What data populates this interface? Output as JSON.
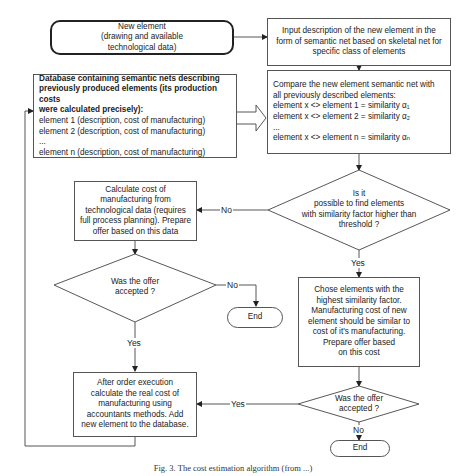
{
  "diagram": {
    "type": "flowchart",
    "nodes": {
      "new_element": {
        "lines": [
          "New element",
          "(drawing and available",
          "technological data)"
        ]
      },
      "input_description": {
        "lines": [
          "Input description of the new element in the",
          "form of semantic net based on skeletal net for",
          "specific class of elements"
        ]
      },
      "database": {
        "title_lines": [
          "Database containing semantic nets describing",
          "previously produced elements (its production costs",
          "were calculated precisely):"
        ],
        "items": [
          "element 1 (description, cost of manufacturing)",
          "element 2 (description, cost of manufacturing)",
          "...",
          "element n (description, cost of manufacturing)"
        ]
      },
      "compare": {
        "lines": [
          "Compare the new element semantic net with",
          "all previously described elements:",
          "element x <> element 1 =  similarity α₁",
          "element x <> element 2 =  similarity α₂",
          "...",
          "element x <> element n =  similarity αₙ"
        ]
      },
      "decision_similarity": {
        "lines": [
          "Is it",
          "possible to find elements",
          "with similarity factor higher than",
          "threshold ?"
        ]
      },
      "calculate_cost": {
        "lines": [
          "Calculate cost of",
          "manufacturing from",
          "technological data (requires",
          "full process planning). Prepare",
          "offer based on this data"
        ]
      },
      "decision_offer_left": {
        "lines": [
          "Was the offer",
          "accepted ?"
        ]
      },
      "end_left": {
        "label": "End"
      },
      "chose_elements": {
        "lines": [
          "Chose elements with the",
          "highest similarity factor.",
          "Manufacturing cost of new",
          "element should be similar to",
          "cost of it's manufacturing.",
          "Prepare offer based",
          "on this cost"
        ]
      },
      "after_order": {
        "lines": [
          "After order execution",
          "calculate the real cost of",
          "manufacturing using",
          "accountants methods. Add",
          "new element to the database."
        ]
      },
      "decision_offer_right": {
        "lines": [
          "Was the offer",
          "accepted ?"
        ]
      },
      "end_bottom": {
        "label": "End"
      }
    },
    "edge_labels": {
      "similarity_no": "No",
      "similarity_yes": "Yes",
      "offer_left_no": "No",
      "offer_left_yes": "Yes",
      "offer_right_yes": "Yes",
      "offer_right_no": "No"
    },
    "caption": "Fig. 3.  The cost estimation algorithm (from ...)"
  }
}
